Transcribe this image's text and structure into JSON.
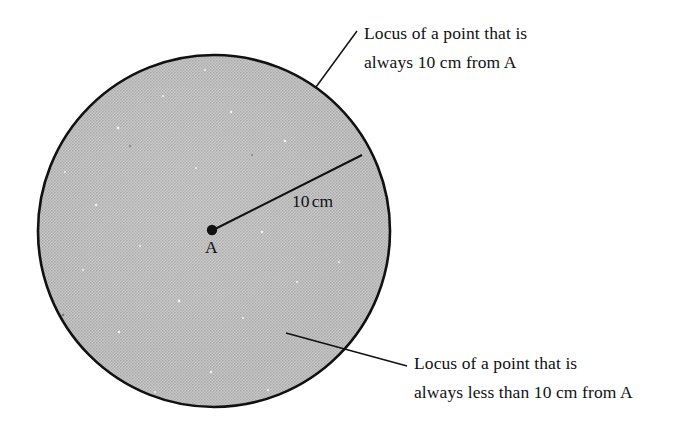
{
  "figure": {
    "background_color": "#ffffff",
    "width": 697,
    "height": 426
  },
  "circle": {
    "name": "locus-circle",
    "center_label": "A",
    "center_x": 214,
    "center_y": 231,
    "radius_px": 176,
    "fill_color": "#b9b9b9",
    "stroke_color": "#111111",
    "stroke_width": 2.6
  },
  "radius": {
    "label_value": "10",
    "label_unit": "cm",
    "stroke_color": "#111111",
    "endpoint_x": 362,
    "endpoint_y": 155
  },
  "callouts": {
    "circumference": {
      "line1": "Locus of a point that is",
      "line2": "always 10 cm from A"
    },
    "interior": {
      "line1": "Locus of a point that is",
      "line2": "always less than 10 cm from A"
    }
  }
}
